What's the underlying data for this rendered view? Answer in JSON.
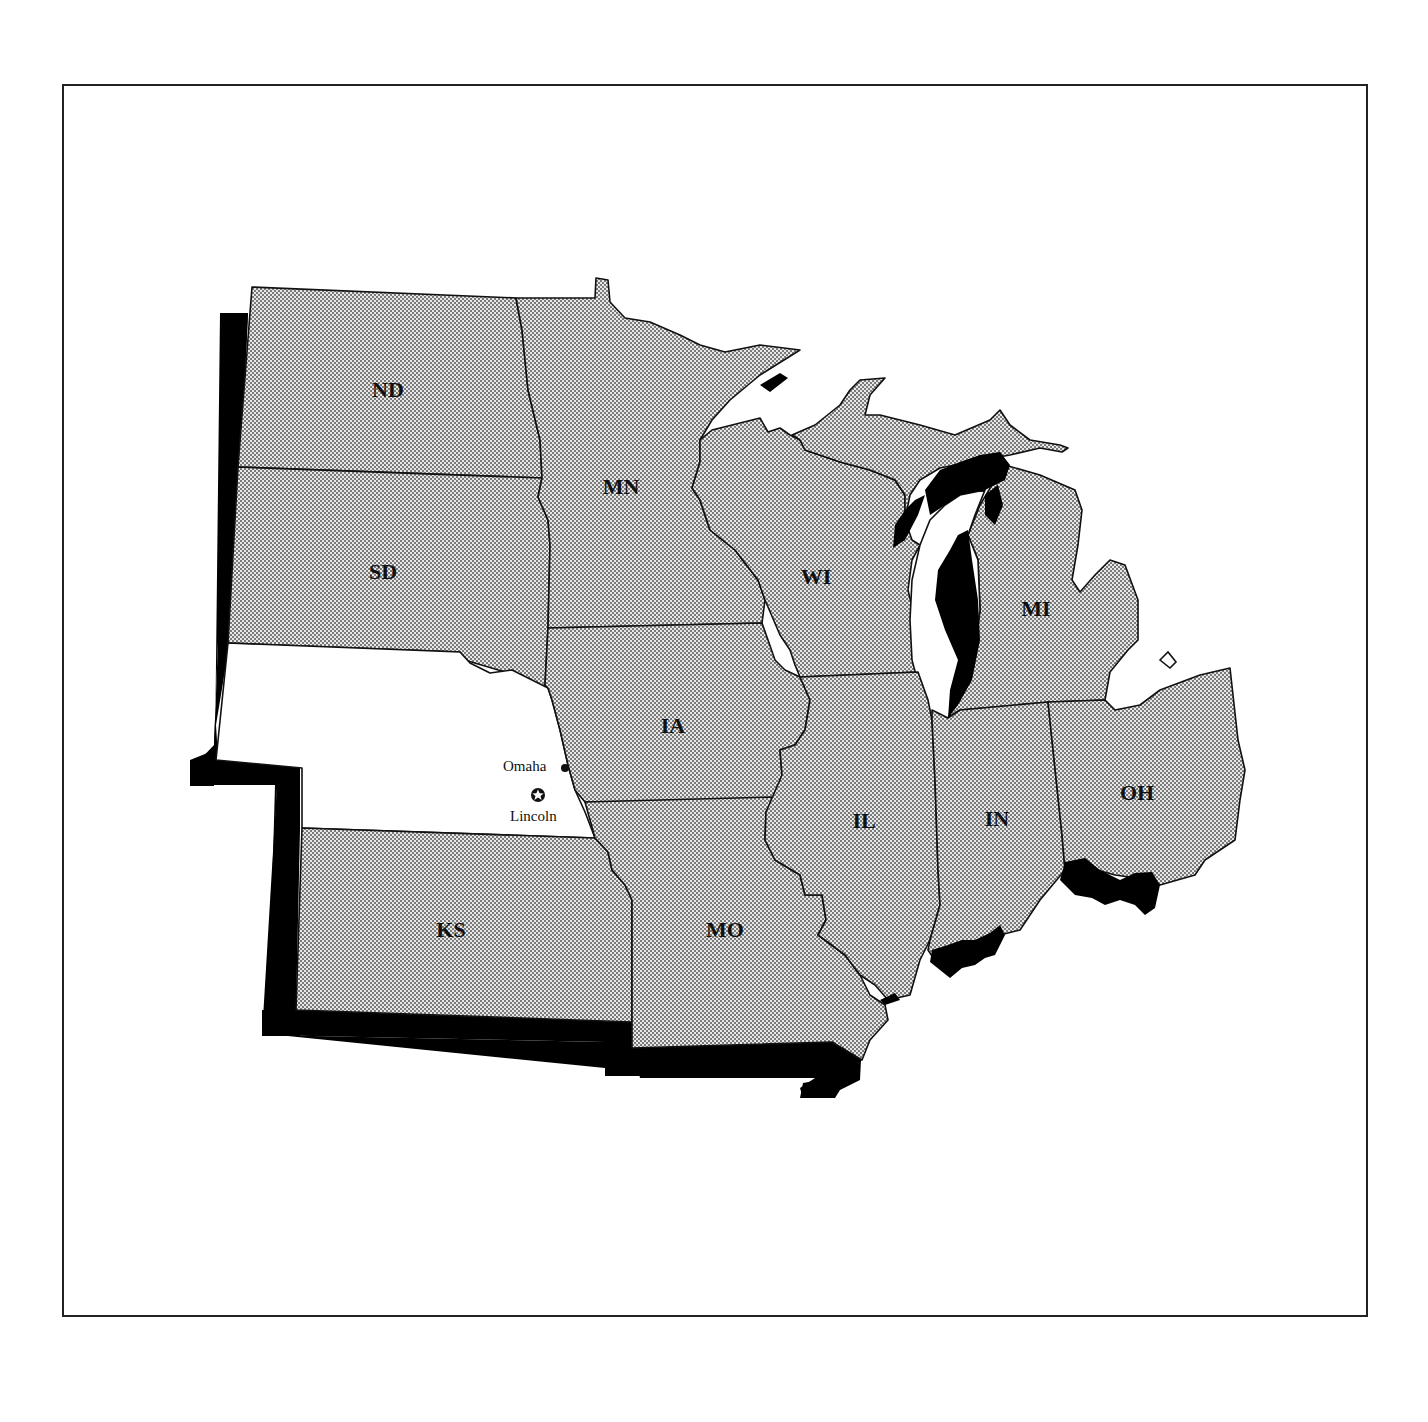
{
  "map": {
    "title": "",
    "region": "Midwest United States",
    "highlight_state": "NE",
    "colors": {
      "state_fill_pattern": "#bdbdbd",
      "highlight_fill": "#ffffff",
      "shadow": "#000000",
      "border": "#111111"
    },
    "states": [
      {
        "abbr": "ND",
        "label": "ND"
      },
      {
        "abbr": "SD",
        "label": "SD"
      },
      {
        "abbr": "NE",
        "label": ""
      },
      {
        "abbr": "KS",
        "label": "KS"
      },
      {
        "abbr": "MN",
        "label": "MN"
      },
      {
        "abbr": "IA",
        "label": "IA"
      },
      {
        "abbr": "MO",
        "label": "MO"
      },
      {
        "abbr": "WI",
        "label": "WI"
      },
      {
        "abbr": "IL",
        "label": "IL"
      },
      {
        "abbr": "MI",
        "label": "MI"
      },
      {
        "abbr": "IN",
        "label": "IN"
      },
      {
        "abbr": "OH",
        "label": "OH"
      }
    ],
    "cities": [
      {
        "name": "Omaha",
        "symbol": "dot-icon"
      },
      {
        "name": "Lincoln",
        "symbol": "star-in-circle-icon",
        "capital": true
      }
    ]
  }
}
